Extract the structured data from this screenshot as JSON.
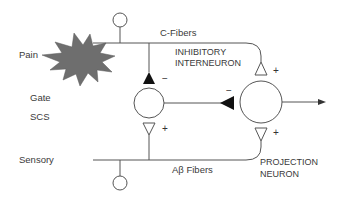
{
  "diagram": {
    "labels": {
      "pain": "Pain",
      "gate": "Gate",
      "scs": "SCS",
      "sensory": "Sensory",
      "c_fibers": "C-Fibers",
      "inhibitory_line1": "INHIBITORY",
      "inhibitory_line2": "INTERNEURON",
      "ab_fibers": "Aβ Fibers",
      "projection_line1": "PROJECTION",
      "projection_line2": "NEURON"
    },
    "signs": {
      "c_to_inhib": "−",
      "c_to_proj": "+",
      "inhib_to_proj": "−",
      "ab_to_inhib": "+",
      "ab_to_proj": "+"
    },
    "nodes": [
      {
        "id": "c-fiber-soma",
        "type": "small-circle"
      },
      {
        "id": "ab-fiber-soma",
        "type": "small-circle"
      },
      {
        "id": "inhibitory-interneuron",
        "type": "circle"
      },
      {
        "id": "projection-neuron",
        "type": "circle"
      },
      {
        "id": "pain-stimulus",
        "type": "starburst"
      }
    ],
    "edges": [
      {
        "from": "c-fiber",
        "to": "inhibitory-interneuron",
        "effect": "inhibitory"
      },
      {
        "from": "c-fiber",
        "to": "projection-neuron",
        "effect": "excitatory"
      },
      {
        "from": "ab-fiber",
        "to": "inhibitory-interneuron",
        "effect": "excitatory"
      },
      {
        "from": "ab-fiber",
        "to": "projection-neuron",
        "effect": "excitatory"
      },
      {
        "from": "inhibitory-interneuron",
        "to": "projection-neuron",
        "effect": "inhibitory"
      },
      {
        "from": "projection-neuron",
        "to": "output",
        "effect": "output"
      }
    ],
    "colors": {
      "line": "#555555",
      "starburst": "#6e6e6e",
      "synapse_inhibitory": "#111111",
      "background": "#ffffff"
    }
  }
}
